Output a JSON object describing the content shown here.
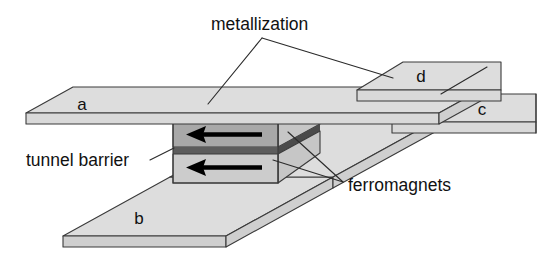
{
  "figure": {
    "kind": "magnetic-tunnel-junction-schematic",
    "background_color": "#ffffff"
  },
  "labels": {
    "metallization": "metallization",
    "tunnel_barrier": "tunnel barrier",
    "ferromagnets": "ferromagnets"
  },
  "terminals": {
    "a": "a",
    "b": "b",
    "c": "c",
    "d": "d"
  },
  "colors": {
    "slab_fill": "#d9d9d9",
    "slab_top": "#dddddd",
    "ferromagnet_top_fill": "#a8a8a8",
    "ferromagnet_bottom_fill": "#cccccc",
    "tunnel_barrier_fill": "#5c5c5c",
    "outline": "#3a3a3a",
    "arrow": "#000000",
    "text": "#111111"
  },
  "magnetization_arrows": [
    {
      "name": "top-ferromagnet-magnetization",
      "direction": "left"
    },
    {
      "name": "bottom-ferromagnet-magnetization",
      "direction": "left"
    }
  ]
}
